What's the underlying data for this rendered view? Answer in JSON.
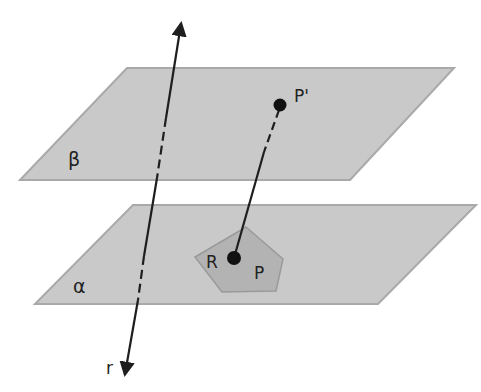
{
  "diagram": {
    "colors": {
      "background": "#ffffff",
      "plane_fill": "#c9c9c9",
      "plane_edge": "#a9a9a9",
      "polygon_fill": "#b3b3b3",
      "polygon_edge": "#9a9a9a",
      "line": "#1e1e1e",
      "point": "#111111"
    },
    "planes": {
      "beta": {
        "label": "β",
        "points": "127,68 454,68 350,180 20,180"
      },
      "alpha": {
        "label": "α",
        "points": "133,205 476,205 378,304 35,304"
      }
    },
    "polygon": {
      "label": "P",
      "points": "246,227 283,259 276,291 222,292 195,257"
    },
    "line_r": {
      "label": "r"
    },
    "points": {
      "p_prime": {
        "label": "P'"
      },
      "r": {
        "label": "R"
      }
    }
  }
}
